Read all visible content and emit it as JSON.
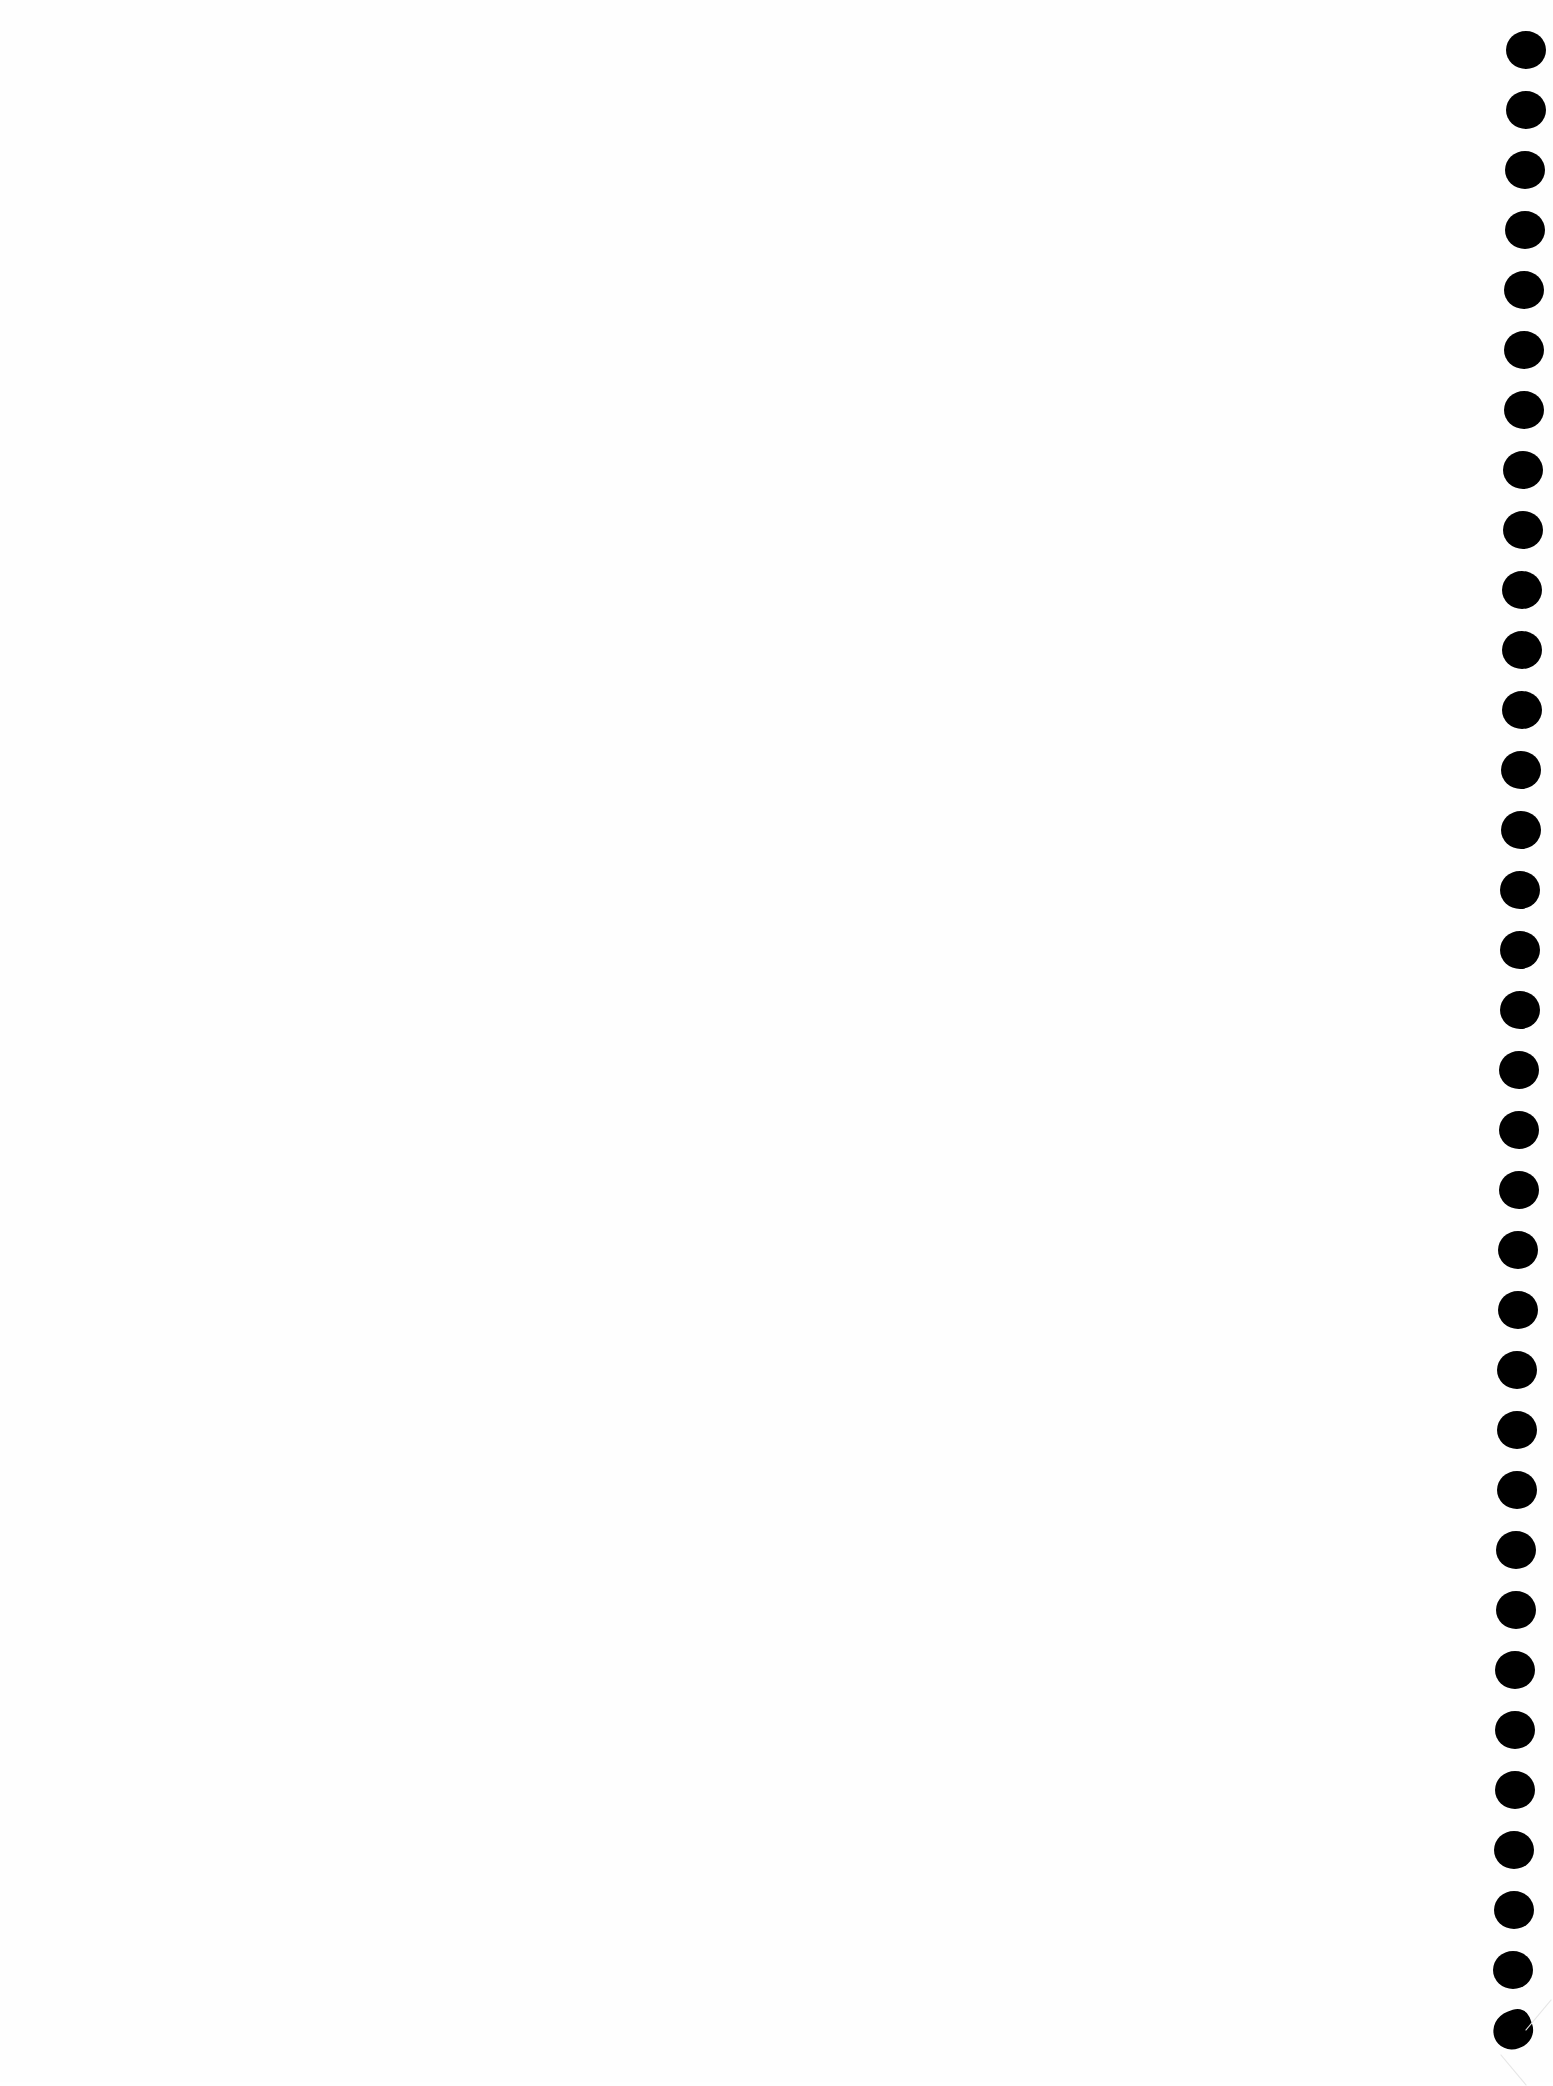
{
  "page": {
    "background": "#fefefe",
    "content_text": ""
  },
  "binding": {
    "hole_color": "#000000",
    "hole_diameter": 40,
    "count": 34,
    "first_center": {
      "x": 1526,
      "y": 50
    },
    "last_center": {
      "x": 1513,
      "y": 2030
    },
    "spacing": 60,
    "last_hole_torn": true
  }
}
